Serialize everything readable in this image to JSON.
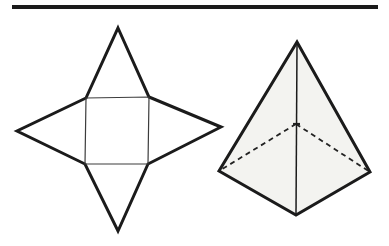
{
  "page": {
    "background": "#ffffff",
    "width": 389,
    "height": 246
  },
  "top_rule": {
    "x1": 12,
    "y1": 7,
    "x2": 378,
    "y2": 7,
    "stroke": "#1b1b1b",
    "stroke_width": 4
  },
  "net": {
    "label": "net-of-square-pyramid",
    "outline_points": "118,28 149,97 221,127 148,164 118,231 85,164 17,131 86,98",
    "outline_stroke": "#1b1b1b",
    "outline_width": 3,
    "fill": "#ffffff",
    "square_points": "86,98 149,97 148,164 85,164",
    "square_stroke": "#3c3c3c",
    "square_width": 1.2
  },
  "pyramid": {
    "label": "square-pyramid-3d",
    "body_points": "297,42 370,172 296,215 219,171",
    "face_fill": "#f3f3f0",
    "solid_stroke": "#1b1b1b",
    "solid_width": 3,
    "front_edge": {
      "x1": 297,
      "y1": 44,
      "x2": 296,
      "y2": 214
    },
    "front_edge_stroke": "#1b1b1b",
    "front_edge_width": 1.5,
    "hidden_left_points": "296,124 219,171",
    "hidden_right_points": "296,124 370,172",
    "hidden_stroke": "#222222",
    "hidden_width": 1.8,
    "hidden_dash": "5 4",
    "back_vertex_mark": {
      "x1": 293,
      "y1": 124,
      "x2": 300,
      "y2": 124
    },
    "back_vertex_width": 2.2
  }
}
